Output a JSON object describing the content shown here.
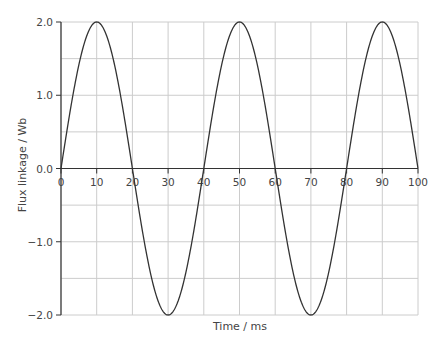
{
  "chart_data": {
    "type": "line",
    "title": "",
    "xlabel": "Time / ms",
    "ylabel": "Flux linkage / Wb",
    "xlim": [
      0,
      100
    ],
    "ylim": [
      -2.0,
      2.0
    ],
    "x_ticks": [
      0,
      10,
      20,
      30,
      40,
      50,
      60,
      70,
      80,
      90,
      100
    ],
    "x_tick_labels": [
      "0",
      "10",
      "20",
      "30",
      "40",
      "50",
      "60",
      "70",
      "80",
      "90",
      "100"
    ],
    "y_ticks": [
      2.0,
      1.0,
      0.0,
      -1.0,
      -2.0
    ],
    "y_tick_labels": [
      "2.0",
      "1.0",
      "0.0",
      "−1.0",
      "−2.0"
    ],
    "grid": true,
    "grid_x_step": 10,
    "grid_y_step": 0.5,
    "legend": null,
    "series": [
      {
        "name": "Flux linkage",
        "function": "2.0 * sin(2*pi*t/40)",
        "amplitude": 2.0,
        "period_ms": 40,
        "x": [
          0,
          10,
          20,
          30,
          40,
          50,
          60,
          70,
          80,
          90,
          100
        ],
        "values": [
          0.0,
          2.0,
          0.0,
          -2.0,
          0.0,
          2.0,
          0.0,
          -2.0,
          0.0,
          2.0,
          0.0
        ]
      }
    ]
  },
  "colors": {
    "curve": "#333333",
    "axis": "#333333",
    "grid": "#cccccc",
    "text": "#444444"
  }
}
